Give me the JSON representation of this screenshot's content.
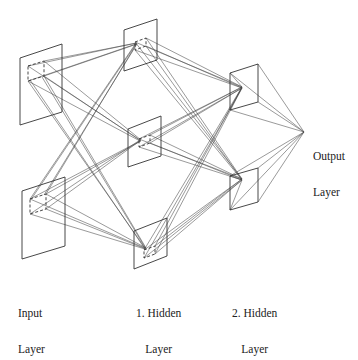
{
  "diagram": {
    "type": "neural-network-architecture",
    "stroke_color": "#333333",
    "background": "#ffffff",
    "labels": {
      "input": [
        "Input",
        "Layer"
      ],
      "hidden1": [
        "1. Hidden",
        "Layer"
      ],
      "hidden2": [
        "2. Hidden",
        "Layer"
      ],
      "output": [
        "Output",
        "Layer"
      ]
    },
    "layers": [
      {
        "name": "Input Layer",
        "planes": 2
      },
      {
        "name": "1. Hidden Layer",
        "planes": 3
      },
      {
        "name": "2. Hidden Layer",
        "planes": 2
      },
      {
        "name": "Output Layer",
        "planes": 0,
        "node": 1
      }
    ]
  }
}
